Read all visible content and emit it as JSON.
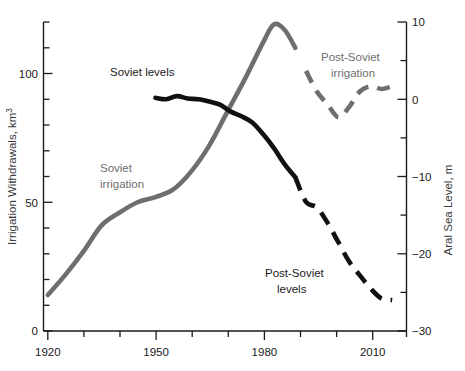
{
  "chart_data": {
    "type": "line",
    "title": "",
    "xlabel": "",
    "ylabel": "Irrigation Withdrawals, km3",
    "y2label": "Aral Sea Level, m",
    "grid": false,
    "legend": "inline-annotations",
    "xlim": [
      1920,
      2020
    ],
    "ylim": [
      0,
      120
    ],
    "y2lim": [
      -30,
      10
    ],
    "x_ticklabels": [
      "1920",
      "1950",
      "1980",
      "2010"
    ],
    "x_tickvalues": [
      1920,
      1950,
      1980,
      2010
    ],
    "x_minor_step": 10,
    "y_ticklabels": [
      "0",
      "50",
      "100"
    ],
    "y_tickvalues": [
      0,
      50,
      100
    ],
    "y_minor_step": 10,
    "y2_ticklabels": [
      "10",
      "0",
      "-10",
      "-20",
      "-30"
    ],
    "y2_tickvalues": [
      10,
      0,
      -10,
      -20,
      -30
    ],
    "y2_minor_step": 5,
    "series": [
      {
        "name": "Soviet irrigation",
        "axis": "left",
        "color": "#6e6e6e",
        "style": "solid",
        "x": [
          1920,
          1925,
          1930,
          1935,
          1940,
          1945,
          1950,
          1955,
          1960,
          1965,
          1970,
          1975,
          1980,
          1983,
          1986,
          1989
        ],
        "values": [
          14,
          22,
          31,
          41,
          46,
          50,
          52,
          55,
          62,
          72,
          85,
          98,
          112,
          119,
          117,
          110
        ]
      },
      {
        "name": "Post-Soviet irrigation",
        "axis": "left",
        "color": "#6e6e6e",
        "style": "dashed",
        "x": [
          1992,
          1995,
          1998,
          2001,
          2004,
          2007,
          2010,
          2013,
          2016
        ],
        "values": [
          101,
          93,
          88,
          83,
          87,
          93,
          95,
          94,
          95
        ]
      },
      {
        "name": "Soviet levels",
        "axis": "right",
        "color": "#111111",
        "style": "solid",
        "x": [
          1950,
          1953,
          1956,
          1959,
          1962,
          1965,
          1968,
          1971,
          1974,
          1977,
          1980,
          1983,
          1986,
          1989
        ],
        "values": [
          0.2,
          0.0,
          0.4,
          0.1,
          0.0,
          -0.3,
          -0.7,
          -1.6,
          -2.2,
          -3.0,
          -4.5,
          -6.3,
          -8.4,
          -10.1
        ]
      },
      {
        "name": "Post-Soviet levels",
        "axis": "right",
        "color": "#111111",
        "style": "dashed",
        "x": [
          1989,
          1992,
          1995,
          1998,
          2001,
          2004,
          2007,
          2010,
          2013,
          2016
        ],
        "values": [
          -10.1,
          -13.3,
          -14.0,
          -16.0,
          -18.5,
          -21.0,
          -22.8,
          -24.5,
          -25.8,
          -26.0
        ]
      }
    ],
    "annotations": [
      {
        "name": "soviet-levels",
        "text": "Soviet levels",
        "color": "#1a1a1a"
      },
      {
        "name": "soviet-irrigation-line1",
        "text": "Soviet",
        "color": "#6e6e6e"
      },
      {
        "name": "soviet-irrigation-line2",
        "text": "irrigation",
        "color": "#6e6e6e"
      },
      {
        "name": "post-soviet-irrigation-line1",
        "text": "Post-Soviet",
        "color": "#6e6e6e"
      },
      {
        "name": "post-soviet-irrigation-line2",
        "text": "irrigation",
        "color": "#6e6e6e"
      },
      {
        "name": "post-soviet-levels-line1",
        "text": "Post-Soviet",
        "color": "#1a1a1a"
      },
      {
        "name": "post-soviet-levels-line2",
        "text": "levels",
        "color": "#1a1a1a"
      }
    ]
  },
  "axes": {
    "left_title_main": "Irrigation Withdrawals, km",
    "left_title_sup": "3",
    "right_title": "Aral Sea Level, m",
    "x_tick_1": "1920",
    "x_tick_2": "1950",
    "x_tick_3": "1980",
    "x_tick_4": "2010",
    "y_tick_0": "0",
    "y_tick_50": "50",
    "y_tick_100": "100",
    "y2_tick_10": "10",
    "y2_tick_0": "0",
    "y2_tick_m10": "−10",
    "y2_tick_m20": "−20",
    "y2_tick_m30": "−30"
  },
  "labels": {
    "soviet_levels": "Soviet levels",
    "soviet_irrigation_1": "Soviet",
    "soviet_irrigation_2": "irrigation",
    "post_soviet_irrigation_1": "Post-Soviet",
    "post_soviet_irrigation_2": "irrigation",
    "post_soviet_levels_1": "Post-Soviet",
    "post_soviet_levels_2": "levels"
  },
  "colors": {
    "irrigation": "#6e6e6e",
    "sea_level": "#111111",
    "axis": "#1a1a1a",
    "background": "#ffffff"
  }
}
